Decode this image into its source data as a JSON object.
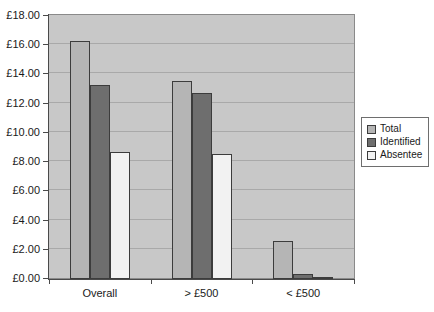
{
  "chart_data": {
    "type": "bar",
    "title": "",
    "subtitle": "",
    "xlabel": "",
    "ylabel": "",
    "categories": [
      "Overall",
      "> £500",
      "< £500"
    ],
    "series": [
      {
        "name": "Total",
        "values": [
          16.3,
          13.55,
          2.6
        ],
        "color": "#b5b5b5"
      },
      {
        "name": "Identified",
        "values": [
          13.3,
          12.75,
          0.35
        ],
        "color": "#6e6e6e"
      },
      {
        "name": "Absentee",
        "values": [
          8.7,
          8.55,
          0.1
        ],
        "color": "#f2f2f2"
      }
    ],
    "ylim": [
      0,
      18
    ],
    "ytick_step": 2,
    "ytick_labels": [
      "£0.00",
      "£2.00",
      "£4.00",
      "£6.00",
      "£8.00",
      "£10.00",
      "£12.00",
      "£14.00",
      "£16.00",
      "£18.00"
    ],
    "ytick_values": [
      0,
      2,
      4,
      6,
      8,
      10,
      12,
      14,
      16,
      18
    ],
    "grid": true,
    "grid_axis": "y",
    "legend_position": "right",
    "plot_background": "#c8c8c8",
    "figure_background": "#ffffff",
    "currency": "£"
  }
}
